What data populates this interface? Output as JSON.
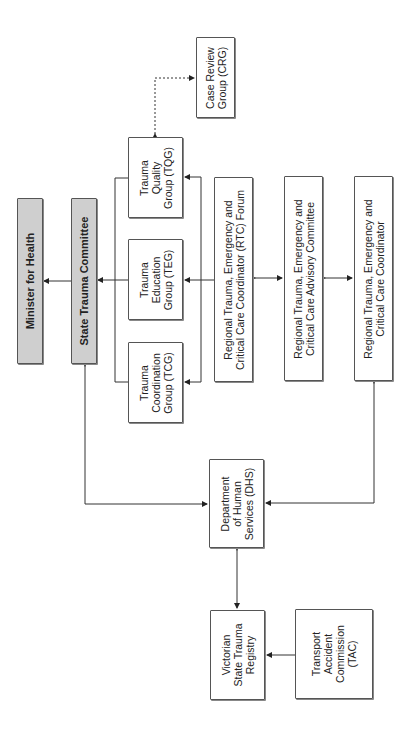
{
  "diagram": {
    "title": "",
    "orientation": "rotated-90-ccw",
    "nodes": {
      "minister": {
        "label": "Minister for Health",
        "style": "grey-bold"
      },
      "stc": {
        "label": "State Trauma Committee",
        "style": "grey-bold"
      },
      "tqg": {
        "label": "Trauma\nQuality\nGroup (TQG)"
      },
      "teg": {
        "label": "Trauma\nEducation\nGroup (TEG)"
      },
      "tcg": {
        "label": "Trauma\nCoordination\nGroup (TCG)"
      },
      "crg": {
        "label": "Case Review\nGroup (CRG)"
      },
      "rtc_forum": {
        "label": "Regional Trauma, Emergency and\nCritical Care Coordinator (RTC) Forum"
      },
      "advisory": {
        "label": "Regional Trauma, Emergency and\nCritical Care Advisory Committee"
      },
      "coordinator": {
        "label": "Regional Trauma, Emergency and\nCritical Care Coordinator"
      },
      "dhs": {
        "label": "Department\nof Human\nServices (DHS)"
      },
      "vstr": {
        "label": "Victorian\nState Trauma\nRegistry"
      },
      "tac": {
        "label": "Transport\nAccident\nCommission\n(TAC)"
      }
    },
    "edges": [
      {
        "from": "stc",
        "to": "minister",
        "type": "arrow"
      },
      {
        "from": "teg_group",
        "to": "stc",
        "type": "arrow"
      },
      {
        "from": "rtc_forum",
        "to": "tqg",
        "type": "arrow"
      },
      {
        "from": "rtc_forum",
        "to": "teg",
        "type": "arrow"
      },
      {
        "from": "rtc_forum",
        "to": "tcg",
        "type": "arrow"
      },
      {
        "from": "tqg",
        "to": "crg",
        "type": "dashed-bidirectional"
      },
      {
        "from": "rtc_forum",
        "to": "advisory",
        "type": "bidirectional"
      },
      {
        "from": "advisory",
        "to": "coordinator",
        "type": "bidirectional"
      },
      {
        "from": "dhs",
        "to": "stc",
        "type": "bidirectional"
      },
      {
        "from": "dhs",
        "to": "coordinator",
        "type": "bidirectional"
      },
      {
        "from": "dhs",
        "to": "vstr",
        "type": "bidirectional"
      },
      {
        "from": "tac",
        "to": "vstr",
        "type": "arrow"
      }
    ]
  }
}
